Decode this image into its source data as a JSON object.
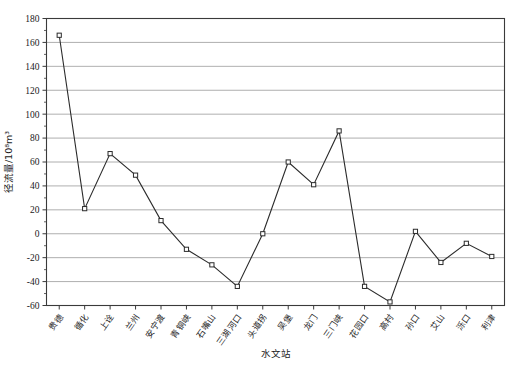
{
  "chart_data": {
    "type": "line",
    "title": "",
    "xlabel": "水文站",
    "ylabel": "径流量/10⁸m³",
    "ylim": [
      -60,
      180
    ],
    "ytick_step": 20,
    "yticks": [
      180,
      160,
      140,
      120,
      100,
      80,
      60,
      40,
      20,
      0,
      -20,
      -40,
      -60
    ],
    "ytick_labels": [
      "180",
      "160",
      "140",
      "120",
      "100",
      "80",
      "60",
      "40",
      "20",
      "0",
      "-20",
      "-40",
      "-60"
    ],
    "grid": "horizontal",
    "legend": "none",
    "marker": "open-square",
    "line_color": "#2b2b2b",
    "grid_color": "#9a9a9a",
    "axis_color": "#3a3a3a",
    "categories": [
      "贵德",
      "循化",
      "上诠",
      "兰州",
      "安宁渡",
      "青铜峡",
      "石嘴山",
      "三湖河口",
      "头道拐",
      "吴堡",
      "龙门",
      "三门峡",
      "花园口",
      "高村",
      "孙口",
      "艾山",
      "泺口",
      "利津"
    ],
    "values": [
      166,
      21,
      67,
      49,
      11,
      -13,
      -26,
      -44,
      0,
      60,
      41,
      86,
      -44,
      -57,
      2,
      -24,
      -8,
      -19
    ],
    "series": [
      {
        "name": "径流量",
        "values": [
          166,
          21,
          67,
          49,
          11,
          -13,
          -26,
          -44,
          0,
          60,
          41,
          86,
          -44,
          -57,
          2,
          -24,
          -8,
          -19
        ]
      }
    ]
  }
}
